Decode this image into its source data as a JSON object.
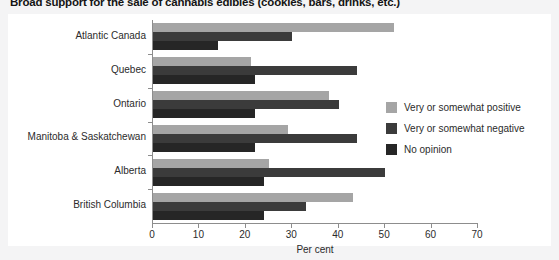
{
  "chart_data": {
    "type": "bar",
    "orientation": "horizontal",
    "title": "Broad support for the sale of cannabis edibles (cookies, bars, drinks, etc.)",
    "xlabel": "Per cent",
    "ylabel": "",
    "xlim": [
      0,
      70
    ],
    "xticks": [
      0,
      10,
      20,
      30,
      40,
      50,
      60,
      70
    ],
    "grid": false,
    "legend_position": "right",
    "categories": [
      "Atlantic Canada",
      "Quebec",
      "Ontario",
      "Manitoba & Saskatchewan",
      "Alberta",
      "British Columbia"
    ],
    "series": [
      {
        "name": "Very or somewhat positive",
        "color": "#a5a5a5",
        "values": [
          52,
          21,
          38,
          29,
          25,
          43
        ]
      },
      {
        "name": "Very or somewhat negative",
        "color": "#3b3b3b",
        "values": [
          30,
          44,
          40,
          44,
          50,
          33
        ]
      },
      {
        "name": "No opinion",
        "color": "#262626",
        "values": [
          14,
          22,
          22,
          22,
          24,
          24
        ]
      }
    ]
  },
  "legend": {
    "items": [
      {
        "label": "Very or somewhat positive",
        "color": "#a5a5a5"
      },
      {
        "label": "Very or somewhat negative",
        "color": "#3b3b3b"
      },
      {
        "label": "No opinion",
        "color": "#262626"
      }
    ]
  },
  "axis": {
    "x_title": "Per cent",
    "x_tick_labels": [
      "0",
      "10",
      "20",
      "30",
      "40",
      "50",
      "60",
      "70"
    ]
  }
}
